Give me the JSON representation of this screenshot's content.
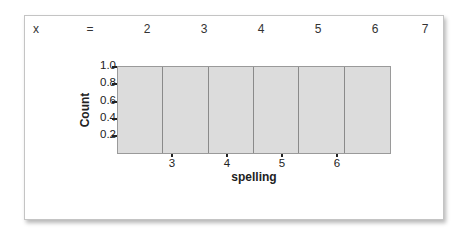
{
  "header_row": {
    "label": "x",
    "equals": "=",
    "values": [
      "2",
      "3",
      "4",
      "5",
      "6",
      "7"
    ]
  },
  "chart_data": {
    "type": "bar",
    "subtype": "histogram",
    "title": "",
    "xlabel": "spelling",
    "ylabel": "Count",
    "bin_edges": [
      2.0,
      2.833,
      3.667,
      4.5,
      5.333,
      6.167,
      7.0
    ],
    "categories": [
      "2.0-2.83",
      "2.83-3.67",
      "3.67-4.5",
      "4.5-5.33",
      "5.33-6.17",
      "6.17-7.0"
    ],
    "values": [
      1,
      1,
      1,
      1,
      1,
      1
    ],
    "xlim": [
      2,
      7
    ],
    "ylim": [
      0,
      1.0
    ],
    "x_ticks": [
      "3",
      "4",
      "5",
      "6"
    ],
    "y_ticks": [
      "0.2",
      "0.4",
      "0.6",
      "0.8",
      "1.0"
    ],
    "grid": false,
    "legend": null,
    "bar_color": "#dcdcdc",
    "edge_color": "#8a8a8a"
  }
}
